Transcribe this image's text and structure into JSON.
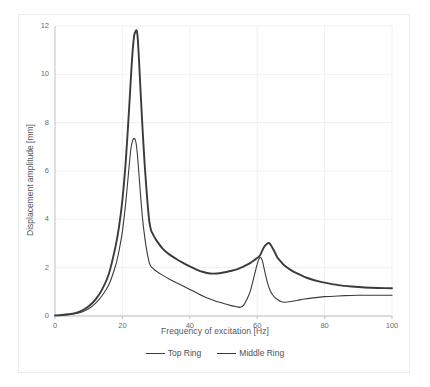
{
  "chart_data": {
    "type": "line",
    "title": "",
    "xlabel": "Frequency of excitation [Hz]",
    "ylabel": "Displacement amplitude [mm]",
    "xlim": [
      0,
      100
    ],
    "ylim": [
      0,
      12
    ],
    "xticks": [
      0,
      20,
      40,
      60,
      80,
      100
    ],
    "yticks": [
      0,
      2,
      4,
      6,
      8,
      10,
      12
    ],
    "xtick_labels": [
      "0",
      "20",
      "40",
      "60",
      "80",
      "100"
    ],
    "ytick_labels": [
      "0",
      "2",
      "4",
      "6",
      "8",
      "10",
      "12"
    ],
    "grid": true,
    "grid_color": "#ececed",
    "legend_position": "bottom",
    "series": [
      {
        "name": "Top Ring",
        "color": "#3b3b3d",
        "line_width": 1.1,
        "x": [
          0,
          2,
          4,
          6,
          8,
          10,
          12,
          14,
          16,
          18,
          19,
          20,
          21,
          22,
          22.5,
          23,
          23.5,
          24,
          24.5,
          25,
          25.5,
          26,
          26.5,
          27,
          27.5,
          28,
          28.5,
          29,
          30,
          32,
          34,
          36,
          38,
          40,
          42,
          44,
          46,
          48,
          50,
          52,
          54,
          55,
          56,
          57,
          58,
          59,
          60,
          60.5,
          61,
          61.5,
          62,
          63,
          64,
          65,
          66,
          67,
          68,
          69,
          70,
          72,
          74,
          76,
          78,
          80,
          84,
          88,
          92,
          96,
          100
        ],
        "y": [
          0.02,
          0.03,
          0.05,
          0.09,
          0.17,
          0.3,
          0.52,
          0.85,
          1.3,
          2.1,
          2.7,
          3.5,
          4.7,
          6.2,
          6.9,
          7.25,
          7.35,
          7.2,
          6.6,
          5.7,
          4.8,
          4.0,
          3.4,
          2.9,
          2.5,
          2.2,
          2.05,
          1.98,
          1.86,
          1.68,
          1.52,
          1.38,
          1.24,
          1.1,
          0.96,
          0.82,
          0.7,
          0.6,
          0.52,
          0.44,
          0.38,
          0.36,
          0.45,
          0.7,
          1.05,
          1.6,
          2.15,
          2.35,
          2.42,
          2.3,
          2.0,
          1.4,
          1.0,
          0.8,
          0.68,
          0.6,
          0.57,
          0.58,
          0.6,
          0.65,
          0.7,
          0.74,
          0.77,
          0.8,
          0.83,
          0.85,
          0.86,
          0.86,
          0.86
        ]
      },
      {
        "name": "Middle Ring",
        "color": "#3b3b3d",
        "line_width": 1.9,
        "x": [
          0,
          2,
          4,
          6,
          8,
          10,
          12,
          14,
          16,
          18,
          19,
          20,
          21,
          22,
          22.5,
          23,
          23.5,
          24,
          24.3,
          24.6,
          25,
          25.5,
          26,
          26.5,
          27,
          27.5,
          28,
          28.5,
          29,
          30,
          32,
          34,
          36,
          38,
          40,
          42,
          44,
          46,
          48,
          50,
          52,
          54,
          56,
          57,
          58,
          59,
          60,
          60.5,
          61,
          62,
          63,
          63.5,
          64,
          65,
          66,
          67,
          68,
          70,
          72,
          74,
          76,
          78,
          80,
          84,
          88,
          92,
          96,
          100
        ],
        "y": [
          0.02,
          0.04,
          0.07,
          0.12,
          0.22,
          0.4,
          0.68,
          1.1,
          1.75,
          2.9,
          3.7,
          4.8,
          6.4,
          8.6,
          9.8,
          10.9,
          11.6,
          11.8,
          11.78,
          11.4,
          10.4,
          9.0,
          7.7,
          6.5,
          5.5,
          4.6,
          3.9,
          3.55,
          3.4,
          3.15,
          2.78,
          2.54,
          2.36,
          2.2,
          2.05,
          1.92,
          1.82,
          1.76,
          1.76,
          1.8,
          1.86,
          1.93,
          2.05,
          2.12,
          2.2,
          2.3,
          2.4,
          2.45,
          2.55,
          2.85,
          3.0,
          3.02,
          2.95,
          2.7,
          2.42,
          2.25,
          2.1,
          1.9,
          1.75,
          1.62,
          1.52,
          1.44,
          1.38,
          1.28,
          1.22,
          1.18,
          1.16,
          1.15
        ]
      }
    ]
  },
  "legend": {
    "items": [
      {
        "label": "Top Ring",
        "style": "thin"
      },
      {
        "label": "Middle Ring",
        "style": "thick"
      }
    ]
  }
}
